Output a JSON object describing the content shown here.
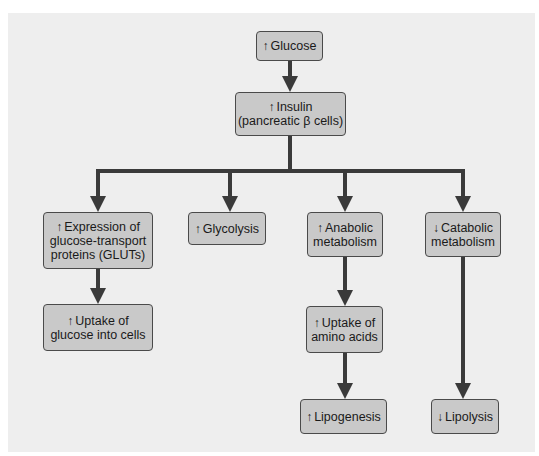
{
  "diagram": {
    "type": "flowchart",
    "colors": {
      "panel": "#eeeeee",
      "box_fill": "#c9c9c9",
      "box_border": "#4a4a4a",
      "arrow": "#3a3a3a"
    },
    "nodes": {
      "glucose": {
        "arrow": "↑",
        "line1": "Glucose"
      },
      "insulin": {
        "arrow": "↑",
        "line1": "Insulin",
        "line2": "(pancreatic β cells)"
      },
      "gluts": {
        "arrow": "↑",
        "line1": "Expression of",
        "line2": "glucose-transport",
        "line3": "proteins (GLUTs)"
      },
      "glycolysis": {
        "arrow": "↑",
        "line1": "Glycolysis"
      },
      "anabolic": {
        "arrow": "↑",
        "line1": "Anabolic",
        "line2": "metabolism"
      },
      "catabolic": {
        "arrow": "↓",
        "line1": "Catabolic",
        "line2": "metabolism"
      },
      "uptake_glucose": {
        "arrow": "↑",
        "line1": "Uptake of",
        "line2": "glucose into cells"
      },
      "uptake_amino": {
        "arrow": "↑",
        "line1": "Uptake of",
        "line2": "amino acids"
      },
      "lipogenesis": {
        "arrow": "↑",
        "line1": "Lipogenesis"
      },
      "lipolysis": {
        "arrow": "↓",
        "line1": "Lipolysis"
      }
    },
    "edges": [
      [
        "glucose",
        "insulin"
      ],
      [
        "insulin",
        "gluts"
      ],
      [
        "insulin",
        "glycolysis"
      ],
      [
        "insulin",
        "anabolic"
      ],
      [
        "insulin",
        "catabolic"
      ],
      [
        "gluts",
        "uptake_glucose"
      ],
      [
        "anabolic",
        "uptake_amino"
      ],
      [
        "uptake_amino",
        "lipogenesis"
      ],
      [
        "catabolic",
        "lipolysis"
      ]
    ]
  }
}
